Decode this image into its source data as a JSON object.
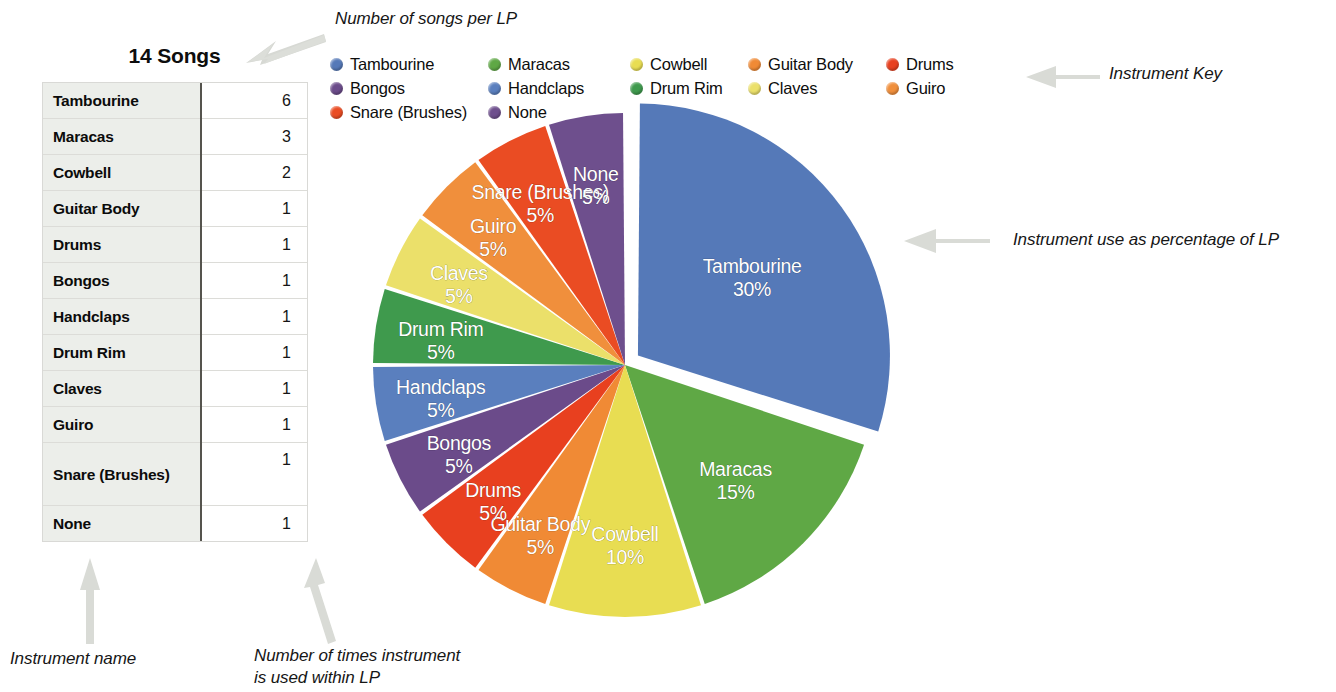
{
  "annotations": {
    "songs_per_lp": "Number of songs per LP",
    "instrument_key": "Instrument Key",
    "instrument_percentage": "Instrument use as percentage of LP",
    "instrument_name": "Instrument name",
    "times_used_line1": "Number of times instrument",
    "times_used_line2": "is used within LP"
  },
  "table": {
    "title": "14 Songs",
    "rows": [
      {
        "name": "Tambourine",
        "count": "6"
      },
      {
        "name": "Maracas",
        "count": "3"
      },
      {
        "name": "Cowbell",
        "count": "2"
      },
      {
        "name": "Guitar Body",
        "count": "1"
      },
      {
        "name": "Drums",
        "count": "1"
      },
      {
        "name": "Bongos",
        "count": "1"
      },
      {
        "name": "Handclaps",
        "count": "1"
      },
      {
        "name": "Drum Rim",
        "count": "1"
      },
      {
        "name": "Claves",
        "count": "1"
      },
      {
        "name": "Guiro",
        "count": "1"
      },
      {
        "name": "Snare (Brushes)",
        "count": "1"
      },
      {
        "name": "None",
        "count": "1"
      }
    ]
  },
  "legend": {
    "items": [
      {
        "label": "Tambourine",
        "color": "#5579b8"
      },
      {
        "label": "Maracas",
        "color": "#5fa845"
      },
      {
        "label": "Cowbell",
        "color": "#e8dd52"
      },
      {
        "label": "Guitar Body",
        "color": "#f08a35"
      },
      {
        "label": "Drums",
        "color": "#e8401f"
      },
      {
        "label": "Bongos",
        "color": "#6b4b8a"
      },
      {
        "label": "Handclaps",
        "color": "#5a7fbe"
      },
      {
        "label": "Drum Rim",
        "color": "#3f9a4d"
      },
      {
        "label": "Claves",
        "color": "#ebe06a"
      },
      {
        "label": "Guiro",
        "color": "#f08f3c"
      },
      {
        "label": "Snare (Brushes)",
        "color": "#ea4c23"
      },
      {
        "label": "None",
        "color": "#6e4f8d"
      }
    ]
  },
  "chart_data": {
    "type": "pie",
    "title": "",
    "unit": "%",
    "total_songs": 14,
    "exploded_slice": "Tambourine",
    "start_angle_deg": 0,
    "direction": "clockwise",
    "labels": [
      "Tambourine",
      "Maracas",
      "Cowbell",
      "Guitar Body",
      "Drums",
      "Bongos",
      "Handclaps",
      "Drum Rim",
      "Claves",
      "Guiro",
      "Snare (Brushes)",
      "None"
    ],
    "values": [
      30,
      15,
      10,
      5,
      5,
      5,
      5,
      5,
      5,
      5,
      5,
      5
    ],
    "counts": [
      6,
      3,
      2,
      1,
      1,
      1,
      1,
      1,
      1,
      1,
      1,
      1
    ],
    "colors": [
      "#5579b8",
      "#5fa845",
      "#e8dd52",
      "#f08a35",
      "#e8401f",
      "#6b4b8a",
      "#5a7fbe",
      "#3f9a4d",
      "#ebe06a",
      "#f08f3c",
      "#ea4c23",
      "#6e4f8d"
    ],
    "slice_labels": [
      {
        "name": "Tambourine",
        "percent": "30%"
      },
      {
        "name": "Maracas",
        "percent": "15%"
      },
      {
        "name": "Cowbell",
        "percent": "10%"
      },
      {
        "name": "Guitar Body",
        "percent": "5%"
      },
      {
        "name": "Drums",
        "percent": "5%"
      },
      {
        "name": "Bongos",
        "percent": "5%"
      },
      {
        "name": "Handclaps",
        "percent": "5%"
      },
      {
        "name": "Drum Rim",
        "percent": "5%"
      },
      {
        "name": "Claves",
        "percent": "5%"
      },
      {
        "name": "Guiro",
        "percent": "5%"
      },
      {
        "name": "Snare (Brushes)",
        "percent": "5%"
      },
      {
        "name": "None",
        "percent": "5%"
      }
    ],
    "legend_position": "top",
    "grid": false
  }
}
